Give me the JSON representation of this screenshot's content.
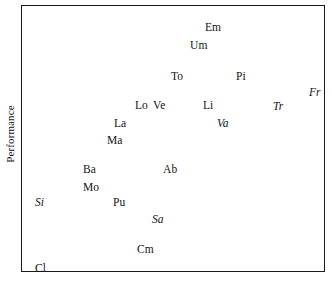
{
  "chart_data": {
    "type": "scatter",
    "title": "",
    "xlabel": "",
    "ylabel": "Performance",
    "grid": false,
    "legend": null,
    "axis_ticks": {
      "x": [],
      "y": []
    },
    "note": "Text-label scatter plot: each data point is rendered as its two-letter abbreviation. Italic labels form a visually distinct subgroup.",
    "points": [
      {
        "label": "Em",
        "x": 204,
        "y": 21,
        "style": "upright"
      },
      {
        "label": "Um",
        "x": 189,
        "y": 39,
        "style": "upright"
      },
      {
        "label": "To",
        "x": 170,
        "y": 70,
        "style": "upright"
      },
      {
        "label": "Pi",
        "x": 235,
        "y": 70,
        "style": "upright"
      },
      {
        "label": "Fr",
        "x": 308,
        "y": 86,
        "style": "italic"
      },
      {
        "label": "Lo",
        "x": 134,
        "y": 99,
        "style": "upright"
      },
      {
        "label": "Ve",
        "x": 152,
        "y": 99,
        "style": "upright"
      },
      {
        "label": "Li",
        "x": 202,
        "y": 99,
        "style": "upright"
      },
      {
        "label": "Tr",
        "x": 272,
        "y": 100,
        "style": "italic"
      },
      {
        "label": "La",
        "x": 113,
        "y": 117,
        "style": "upright"
      },
      {
        "label": "Va",
        "x": 216,
        "y": 117,
        "style": "italic"
      },
      {
        "label": "Ma",
        "x": 106,
        "y": 134,
        "style": "upright"
      },
      {
        "label": "Ba",
        "x": 82,
        "y": 163,
        "style": "upright"
      },
      {
        "label": "Ab",
        "x": 162,
        "y": 163,
        "style": "upright"
      },
      {
        "label": "Mo",
        "x": 82,
        "y": 181,
        "style": "upright"
      },
      {
        "label": "Si",
        "x": 34,
        "y": 196,
        "style": "italic"
      },
      {
        "label": "Pu",
        "x": 112,
        "y": 196,
        "style": "upright"
      },
      {
        "label": "Sa",
        "x": 151,
        "y": 213,
        "style": "italic"
      },
      {
        "label": "Cm",
        "x": 136,
        "y": 243,
        "style": "upright"
      },
      {
        "label": "Cl",
        "x": 34,
        "y": 262,
        "style": "upright"
      }
    ]
  },
  "axes": {
    "y_title": "Performance"
  }
}
